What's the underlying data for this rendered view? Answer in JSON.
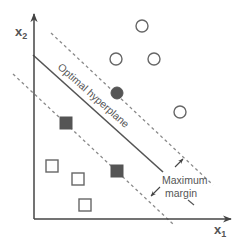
{
  "axes": {
    "x_label": "x",
    "x_subscript": "1",
    "y_label": "x",
    "y_subscript": "2"
  },
  "annotations": {
    "hyperplane_label": "Optimal hyperplane",
    "margin_label_line1": "Maximum",
    "margin_label_line2": "margin"
  },
  "classes": {
    "circles": {
      "open": [
        {
          "cx": 142,
          "cy": 26
        },
        {
          "cx": 116,
          "cy": 59
        },
        {
          "cx": 154,
          "cy": 59
        },
        {
          "cx": 180,
          "cy": 112
        }
      ],
      "support_vectors": [
        {
          "cx": 117,
          "cy": 93
        }
      ]
    },
    "squares": {
      "open": [
        {
          "cx": 52,
          "cy": 166
        },
        {
          "cx": 78,
          "cy": 179
        },
        {
          "cx": 85,
          "cy": 205
        }
      ],
      "support_vectors": [
        {
          "cx": 66,
          "cy": 123
        },
        {
          "cx": 117,
          "cy": 171
        }
      ]
    }
  },
  "colors": {
    "axis": "#444444",
    "hyperplane": "#555555",
    "margin_lines": "#888888",
    "marker_stroke": "#666666",
    "support_vector_fill": "#555555",
    "text": "#555555"
  }
}
